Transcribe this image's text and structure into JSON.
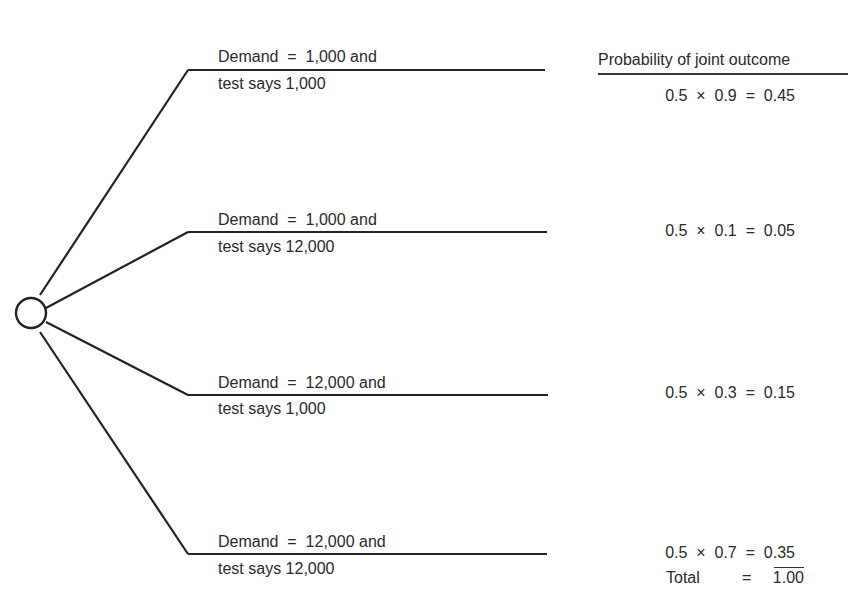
{
  "header": {
    "title": "Probability of joint outcome"
  },
  "branches": [
    {
      "line1": "Demand  =  1,000 and",
      "line2": "test says 1,000",
      "prob": "0.5  ×  0.9  =  0.45"
    },
    {
      "line1": "Demand  =  1,000 and",
      "line2": "test says 12,000",
      "prob": "0.5  ×  0.1  =  0.05"
    },
    {
      "line1": "Demand  =  12,000 and",
      "line2": "test says 1,000",
      "prob": "0.5  ×  0.3  =  0.15"
    },
    {
      "line1": "Demand  =  12,000 and",
      "line2": "test says 12,000",
      "prob": "0.5  ×  0.7  =  0.35"
    }
  ],
  "total": {
    "label": "Total",
    "equals": "=",
    "value": "1.00"
  },
  "colors": {
    "ink": "#2a2a2a",
    "background": "#ffffff"
  }
}
